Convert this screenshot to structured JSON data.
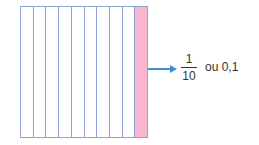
{
  "diagram": {
    "grid": {
      "columns": 10,
      "shaded_columns": [
        10
      ],
      "shaded_color": "#f7b6cd",
      "line_color": "#8fa3d6"
    },
    "arrow_color": "#3f8fd6",
    "fraction": {
      "numerator": "1",
      "denominator": "10"
    },
    "label": "ou 0,1"
  }
}
